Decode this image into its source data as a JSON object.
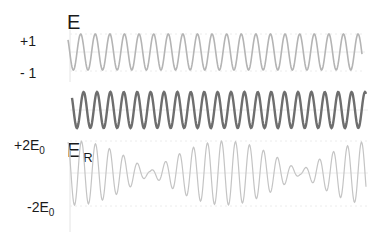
{
  "labels": {
    "top_title": "E",
    "top_plus": "+1",
    "top_minus": "- 1",
    "beat_title": "E",
    "beat_title_sub": "R",
    "beat_plus": "+2E",
    "beat_plus_sub": "0",
    "beat_minus": "-2E",
    "beat_minus_sub": "0"
  },
  "colors": {
    "wave1": "#b4b4b4",
    "wave2": "#6e6e6e",
    "beat": "#c4c4c4",
    "axis": "#e4e4e4",
    "grid": "#ececec"
  },
  "chart_data": {
    "type": "line",
    "series": [
      {
        "name": "E (wave 1)",
        "amplitude": 1,
        "period_px": 14.6,
        "x_start": 68,
        "x_end": 362,
        "center_y": 52,
        "amp_px": 18,
        "phase": 0
      },
      {
        "name": "E (wave 2)",
        "amplitude": 1,
        "period_px": 13.4,
        "x_start": 72,
        "x_end": 366,
        "center_y": 110,
        "amp_px": 18,
        "phase": 0
      },
      {
        "name": "E_R (sum)",
        "amplitude": 2,
        "x_start": 68,
        "x_end": 366,
        "center_y": 173,
        "amp_px": 32,
        "beat_minima_x": [
          150,
          300
        ],
        "beat_maxima_x": [
          225,
          372
        ]
      }
    ],
    "y_ticks_top": [
      "+1",
      "- 1"
    ],
    "y_ticks_beat": [
      "+2E0",
      "-2E0"
    ]
  }
}
